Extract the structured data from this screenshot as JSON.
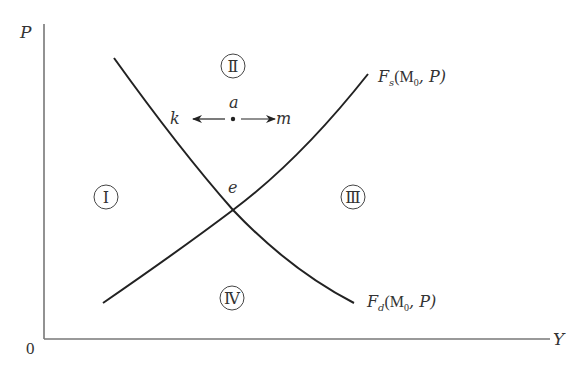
{
  "axes": {
    "y_label": "P",
    "x_label": "Y",
    "origin_label": "0"
  },
  "curves": {
    "supply": {
      "label_main": "F",
      "label_sub": "s",
      "label_args": "(M",
      "label_arg_sub": "0",
      "label_tail": ", P)"
    },
    "demand": {
      "label_main": "F",
      "label_sub": "d",
      "label_args": "(M",
      "label_arg_sub": "0",
      "label_tail": ", P)"
    }
  },
  "points": {
    "a": "a",
    "e": "e",
    "k": "k",
    "m": "m"
  },
  "regions": {
    "r1": "Ⅰ",
    "r2": "Ⅱ",
    "r3": "Ⅲ",
    "r4": "Ⅳ"
  }
}
